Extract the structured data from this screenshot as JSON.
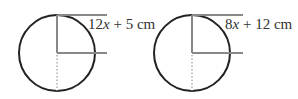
{
  "figures": [
    {
      "id": "circle-a",
      "label_parts": [
        "12",
        "x",
        " + 5 cm"
      ],
      "label": "12x + 5 cm",
      "cx": 57,
      "cy": 53,
      "r": 38,
      "line_end_x": 107
    },
    {
      "id": "circle-b",
      "label_parts": [
        "8",
        "x",
        " + 12 cm"
      ],
      "label": "8x + 12 cm",
      "cx": 192,
      "cy": 53,
      "r": 38,
      "line_end_x": 242
    }
  ],
  "colors": {
    "circle_stroke": "#222222",
    "radius_lines": "#888888",
    "dotted_line": "#999999",
    "text": "#333333"
  }
}
